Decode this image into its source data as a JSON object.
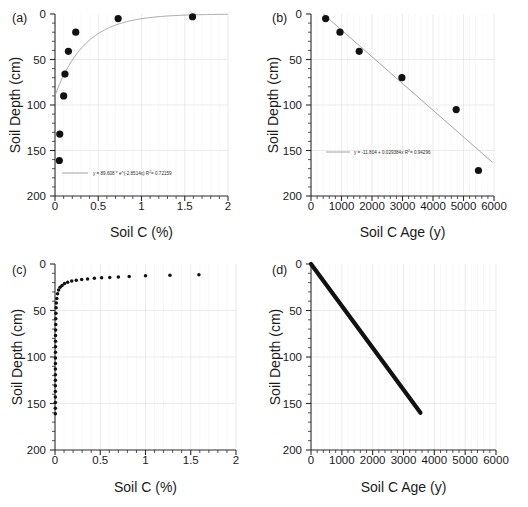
{
  "figure": {
    "panels": [
      "a",
      "b",
      "c",
      "d"
    ]
  },
  "panel_a": {
    "label": "(a)",
    "xlabel": "Soil C (%)",
    "ylabel": "Soil Depth (cm)",
    "xticks": [
      "0",
      "0.5",
      "1",
      "1.5",
      "2"
    ],
    "yticks": [
      "0",
      "50",
      "100",
      "150",
      "200"
    ],
    "fit_text": "y = 89.608 * e^(-2.8514x)   R",
    "fit_sup": "2",
    "fit_text2": "= 0.72159"
  },
  "panel_b": {
    "label": "(b)",
    "xlabel": "Soil C Age (y)",
    "ylabel": "Soil Depth (cm)",
    "xticks": [
      "0",
      "1000",
      "2000",
      "3000",
      "4000",
      "5000",
      "6000"
    ],
    "yticks": [
      "0",
      "50",
      "100",
      "150",
      "200"
    ],
    "fit_text": "y = -11.804 + 0.029384x   R",
    "fit_sup": "2",
    "fit_text2": "= 0.94296"
  },
  "panel_c": {
    "label": "(c)",
    "xlabel": "Soil C (%)",
    "ylabel": "Soil Depth (cm)",
    "xticks": [
      "0",
      "0.5",
      "1",
      "1.5",
      "2"
    ],
    "yticks": [
      "0",
      "50",
      "100",
      "150",
      "200"
    ]
  },
  "panel_d": {
    "label": "(d)",
    "xlabel": "Soil C Age (y)",
    "ylabel": "Soil Depth (cm)",
    "xticks": [
      "0",
      "1000",
      "2000",
      "3000",
      "4000",
      "5000",
      "6000"
    ],
    "yticks": [
      "0",
      "50",
      "100",
      "150",
      "200"
    ]
  },
  "chart_data": [
    {
      "panel": "a",
      "type": "scatter",
      "title": "",
      "xlabel": "Soil C (%)",
      "ylabel": "Soil Depth (cm)",
      "xlim": [
        0,
        2
      ],
      "ylim": [
        200,
        0
      ],
      "y_inverted": true,
      "grid": true,
      "xticks": [
        0,
        0.5,
        1,
        1.5,
        2
      ],
      "yticks": [
        0,
        50,
        100,
        150,
        200
      ],
      "points": [
        {
          "x": 1.59,
          "y": 3
        },
        {
          "x": 0.73,
          "y": 5
        },
        {
          "x": 0.24,
          "y": 20
        },
        {
          "x": 0.155,
          "y": 41
        },
        {
          "x": 0.115,
          "y": 66
        },
        {
          "x": 0.1,
          "y": 90
        },
        {
          "x": 0.055,
          "y": 132
        },
        {
          "x": 0.05,
          "y": 161
        }
      ],
      "fit": {
        "kind": "exponential",
        "equation": "y = 89.608 * e^(-2.8514x)",
        "a": 89.608,
        "b": -2.8514,
        "r2": 0.72159,
        "label": "y = 89.608 * e^(-2.8514x)   R2= 0.72159"
      }
    },
    {
      "panel": "b",
      "type": "scatter",
      "title": "",
      "xlabel": "Soil C Age (y)",
      "ylabel": "Soil Depth (cm)",
      "xlim": [
        0,
        6000
      ],
      "ylim": [
        200,
        0
      ],
      "y_inverted": true,
      "grid": true,
      "xticks": [
        0,
        1000,
        2000,
        3000,
        4000,
        5000,
        6000
      ],
      "yticks": [
        0,
        50,
        100,
        150,
        200
      ],
      "points": [
        {
          "x": 480,
          "y": 5
        },
        {
          "x": 950,
          "y": 20
        },
        {
          "x": 1580,
          "y": 41
        },
        {
          "x": 2980,
          "y": 70
        },
        {
          "x": 4760,
          "y": 105
        },
        {
          "x": 5490,
          "y": 172
        }
      ],
      "fit": {
        "kind": "linear",
        "equation": "y = -11.804 + 0.029384x",
        "intercept": -11.804,
        "slope": 0.029384,
        "r2": 0.94296,
        "label": "y = -11.804 + 0.029384x   R2= 0.94296"
      }
    },
    {
      "panel": "c",
      "type": "scatter",
      "title": "",
      "xlabel": "Soil C (%)",
      "ylabel": "Soil Depth (cm)",
      "xlim": [
        0,
        2
      ],
      "ylim": [
        200,
        0
      ],
      "y_inverted": true,
      "grid": true,
      "xticks": [
        0,
        0.5,
        1,
        1.5,
        2
      ],
      "yticks": [
        0,
        50,
        100,
        150,
        200
      ],
      "description": "Modelled soil C vs depth: dense near-vertical tail at low C from 35-160 cm, curving to widely spaced points approaching 10-13 cm depth at high C",
      "points": [
        {
          "x": 0.004,
          "y": 161
        },
        {
          "x": 0.004,
          "y": 155
        },
        {
          "x": 0.004,
          "y": 149
        },
        {
          "x": 0.004,
          "y": 143
        },
        {
          "x": 0.004,
          "y": 137
        },
        {
          "x": 0.004,
          "y": 131
        },
        {
          "x": 0.0045,
          "y": 125
        },
        {
          "x": 0.0045,
          "y": 119
        },
        {
          "x": 0.0045,
          "y": 113
        },
        {
          "x": 0.005,
          "y": 107
        },
        {
          "x": 0.005,
          "y": 101
        },
        {
          "x": 0.005,
          "y": 95
        },
        {
          "x": 0.0055,
          "y": 89
        },
        {
          "x": 0.006,
          "y": 83
        },
        {
          "x": 0.006,
          "y": 77
        },
        {
          "x": 0.007,
          "y": 71
        },
        {
          "x": 0.008,
          "y": 65
        },
        {
          "x": 0.009,
          "y": 59
        },
        {
          "x": 0.01,
          "y": 53
        },
        {
          "x": 0.012,
          "y": 47
        },
        {
          "x": 0.015,
          "y": 42
        },
        {
          "x": 0.02,
          "y": 37
        },
        {
          "x": 0.028,
          "y": 32
        },
        {
          "x": 0.04,
          "y": 28
        },
        {
          "x": 0.056,
          "y": 25
        },
        {
          "x": 0.078,
          "y": 23
        },
        {
          "x": 0.105,
          "y": 21
        },
        {
          "x": 0.14,
          "y": 19.5
        },
        {
          "x": 0.185,
          "y": 18.3
        },
        {
          "x": 0.235,
          "y": 17.4
        },
        {
          "x": 0.295,
          "y": 16.6
        },
        {
          "x": 0.36,
          "y": 16.0
        },
        {
          "x": 0.435,
          "y": 15.4
        },
        {
          "x": 0.515,
          "y": 14.9
        },
        {
          "x": 0.605,
          "y": 14.4
        },
        {
          "x": 0.7,
          "y": 14.0
        },
        {
          "x": 0.82,
          "y": 13.4
        },
        {
          "x": 1.0,
          "y": 12.7
        },
        {
          "x": 1.27,
          "y": 12.2
        },
        {
          "x": 1.59,
          "y": 11.6
        }
      ]
    },
    {
      "panel": "d",
      "type": "line",
      "title": "",
      "xlabel": "Soil C Age (y)",
      "ylabel": "Soil Depth (cm)",
      "xlim": [
        0,
        6000
      ],
      "ylim": [
        200,
        0
      ],
      "y_inverted": true,
      "grid": true,
      "xticks": [
        0,
        1000,
        2000,
        3000,
        4000,
        5000,
        6000
      ],
      "yticks": [
        0,
        50,
        100,
        150,
        200
      ],
      "description": "Thick straight modelled line from origin to about 3550 y at 160 cm depth",
      "x": [
        0,
        3550
      ],
      "values": [
        0,
        160
      ]
    }
  ]
}
